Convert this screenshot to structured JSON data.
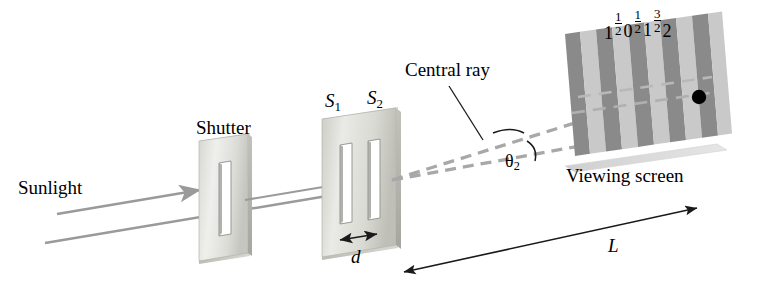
{
  "figure": {
    "kind": "optics-diagram",
    "background_color": "#ffffff"
  },
  "labels": {
    "sunlight": "Sunlight",
    "shutter": "Shutter",
    "slit1": "S",
    "slit1_sub": "1",
    "slit2": "S",
    "slit2_sub": "2",
    "slit_separation": "d",
    "central_ray": "Central ray",
    "theta": "θ",
    "theta_sub": "2",
    "viewing_screen": "Viewing screen",
    "distance": "L"
  },
  "fringe_orders": [
    {
      "id": "m-minus-1",
      "text": "1",
      "type": "integer"
    },
    {
      "id": "m-minus-half",
      "text": "1/2",
      "type": "fraction",
      "numerator": "1",
      "denominator": "2"
    },
    {
      "id": "m-zero",
      "text": "0",
      "type": "integer"
    },
    {
      "id": "m-plus-half",
      "text": "1/2",
      "type": "fraction",
      "numerator": "1",
      "denominator": "2"
    },
    {
      "id": "m-plus-one",
      "text": "1",
      "type": "integer"
    },
    {
      "id": "m-plus-threehalf",
      "text": "3/2",
      "type": "fraction",
      "numerator": "3",
      "denominator": "2"
    },
    {
      "id": "m-plus-two",
      "text": "2",
      "type": "integer"
    }
  ],
  "colors": {
    "ink": "#1a1a1a",
    "beam_gray": "#9a9a9a",
    "dashed_ray": "#a8a8a8",
    "plate_light": "#e8e8e6",
    "plate_mid": "#cfcfcb",
    "plate_edge": "#b4b4ae",
    "plate_shadow": "#9e9e98",
    "slit_dark": "#8e8e8a",
    "fringe_dark": "#8a8a8a",
    "fringe_light": "#c9c9c9",
    "screen_edge": "#d9d9d9",
    "dot": "#000000"
  },
  "elements": {
    "shutter_plate": "single-slit shutter plate",
    "double_slit_plate": "double-slit plate",
    "viewing_screen_panel": "striped interference fringe screen",
    "bright_spot_marker": "black dot on fringe order 2",
    "angle_arc": "angle arc between central ray and second ray",
    "length_arrow": "double-headed arrow for distance L",
    "separation_arrow": "double-headed arrow for slit separation d"
  }
}
